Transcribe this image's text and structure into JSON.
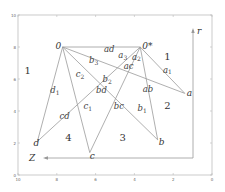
{
  "chart_data": {
    "type": "diagram",
    "axes": {
      "x_ticks": [
        "10",
        "8",
        "6",
        "4",
        "2",
        "0"
      ],
      "y_ticks": [
        "0",
        "2",
        "4",
        "6",
        "8",
        "10"
      ],
      "x_range": [
        10,
        0
      ],
      "y_range": [
        0,
        10
      ]
    },
    "axis_labels": {
      "z": "Z",
      "r": "r"
    },
    "vertices": [
      {
        "id": "o",
        "label": "0",
        "x": 7.7,
        "y": 8.0
      },
      {
        "id": "ostar",
        "label": "0*",
        "x": 3.7,
        "y": 8.0
      },
      {
        "id": "a",
        "label": "a",
        "x": 1.4,
        "y": 5.1
      },
      {
        "id": "b",
        "label": "b",
        "x": 2.8,
        "y": 2.2
      },
      {
        "id": "c",
        "label": "c",
        "x": 6.3,
        "y": 1.4
      },
      {
        "id": "d",
        "label": "d",
        "x": 9.0,
        "y": 2.1
      }
    ],
    "edges": [
      [
        "o",
        "ostar"
      ],
      [
        "o",
        "a"
      ],
      [
        "o",
        "b"
      ],
      [
        "o",
        "c"
      ],
      [
        "o",
        "d"
      ],
      [
        "ostar",
        "a"
      ],
      [
        "ostar",
        "b"
      ],
      [
        "ostar",
        "c"
      ],
      [
        "ostar",
        "d"
      ]
    ],
    "region_labels": [
      {
        "label": "1",
        "x": 9.5,
        "y": 6.3
      },
      {
        "label": "1",
        "x": 2.3,
        "y": 7.2
      },
      {
        "label": "2",
        "x": 2.3,
        "y": 4.1
      },
      {
        "label": "3",
        "x": 4.6,
        "y": 2.1
      },
      {
        "label": "4",
        "x": 7.4,
        "y": 2.1
      }
    ],
    "edge_labels": [
      {
        "label": "ad",
        "x": 5.3,
        "y": 7.7
      },
      {
        "label": "b3",
        "x": 6.1,
        "y": 7.0
      },
      {
        "label": "a3",
        "x": 4.6,
        "y": 7.3
      },
      {
        "label": "a2",
        "x": 3.9,
        "y": 7.2
      },
      {
        "label": "ac",
        "x": 4.3,
        "y": 6.6
      },
      {
        "label": "a1",
        "x": 2.3,
        "y": 6.4
      },
      {
        "label": "c2",
        "x": 6.8,
        "y": 6.1
      },
      {
        "label": "b2",
        "x": 5.4,
        "y": 5.8
      },
      {
        "label": "bd",
        "x": 5.7,
        "y": 5.1
      },
      {
        "label": "ab",
        "x": 3.3,
        "y": 5.2
      },
      {
        "label": "d1",
        "x": 8.1,
        "y": 5.1
      },
      {
        "label": "c1",
        "x": 6.4,
        "y": 4.1
      },
      {
        "label": "bc",
        "x": 4.8,
        "y": 4.1
      },
      {
        "label": "b1",
        "x": 3.6,
        "y": 4.0
      },
      {
        "label": "cd",
        "x": 7.6,
        "y": 3.5
      }
    ]
  }
}
